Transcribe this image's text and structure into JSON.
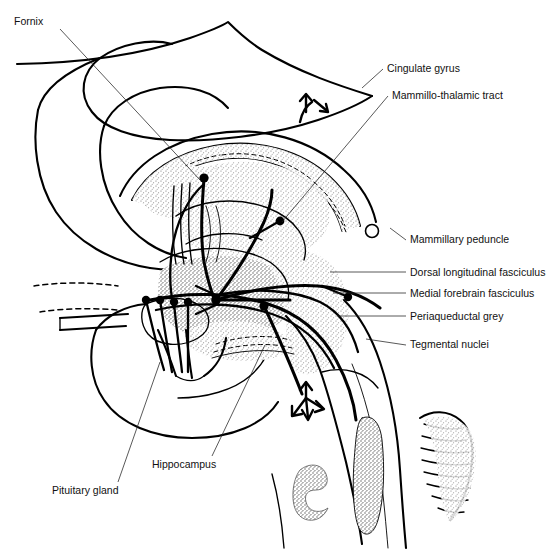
{
  "page": {
    "running_head": "",
    "page_number": "",
    "width": 560,
    "height": 553,
    "background": "#ffffff",
    "ink": "#000000"
  },
  "figure": {
    "name": "hypothalamic-connections-diagram",
    "stipple_color": "#7a7a7a"
  },
  "labels": [
    {
      "id": "fornix",
      "text": "Fornix",
      "text_x": 14,
      "text_y": 25,
      "anchor": "start",
      "leader": "M 60,29 L 200,180"
    },
    {
      "id": "cingulate-gyrus",
      "text": "Cingulate gyrus",
      "text_x": 387,
      "text_y": 72,
      "anchor": "start",
      "leader": "M 383,69 L 362,88"
    },
    {
      "id": "mammillo-thalamic-tract",
      "text": "Mammillo-thalamic tract",
      "text_x": 392,
      "text_y": 99,
      "anchor": "start",
      "leader": "M 388,96 L 282,222"
    },
    {
      "id": "mammillary-peduncle",
      "text": "Mammillary peduncle",
      "text_x": 410,
      "text_y": 243,
      "anchor": "start",
      "leader": "M 406,240 L 390,228"
    },
    {
      "id": "dorsal-longitudinal-fasciculus",
      "text": "Dorsal longitudinal fasciculus",
      "text_x": 410,
      "text_y": 276,
      "anchor": "start",
      "leader": "M 406,272 L 330,272"
    },
    {
      "id": "medial-forebrain-fasciculus",
      "text": "Medial forebrain fasciculus",
      "text_x": 410,
      "text_y": 297,
      "anchor": "start",
      "leader": "M 406,293 L 333,293"
    },
    {
      "id": "periaqueductal-grey",
      "text": "Periaqueductal grey",
      "text_x": 410,
      "text_y": 320,
      "anchor": "start",
      "leader": "M 406,316 L 337,316"
    },
    {
      "id": "tegmental-nuclei",
      "text": "Tegmental nuclei",
      "text_x": 410,
      "text_y": 348,
      "anchor": "start",
      "leader": "M 406,345 L 366,339"
    },
    {
      "id": "hippocampus",
      "text": "Hippocampus",
      "text_x": 152,
      "text_y": 468,
      "anchor": "start",
      "leader": "M 212,456 L 265,345"
    },
    {
      "id": "pituitary-gland",
      "text": "Pituitary gland",
      "text_x": 52,
      "text_y": 494,
      "anchor": "start",
      "leader": "M 118,482 L 160,362"
    }
  ],
  "arrows": [
    {
      "id": "cingulate-bidirectional-arrow",
      "x": 308,
      "y": 108
    },
    {
      "id": "descending-tegmental-arrow",
      "x": 310,
      "y": 400
    }
  ]
}
